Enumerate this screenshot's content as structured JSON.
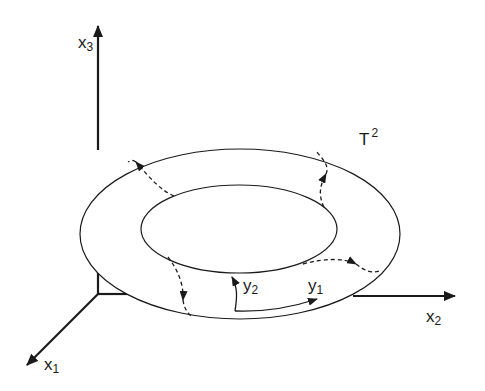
{
  "figure": {
    "surface_label": {
      "main": "T",
      "sup": "2"
    },
    "axes": [
      {
        "id": "x1",
        "main": "x",
        "sub": "1"
      },
      {
        "id": "x2",
        "main": "x",
        "sub": "2"
      },
      {
        "id": "x3",
        "main": "x",
        "sub": "3"
      }
    ],
    "torus_coords": [
      {
        "id": "y1",
        "main": "y",
        "sub": "1"
      },
      {
        "id": "y2",
        "main": "y",
        "sub": "2"
      }
    ],
    "colors": {
      "ink": "#1a1a1a",
      "background": "#ffffff"
    }
  }
}
